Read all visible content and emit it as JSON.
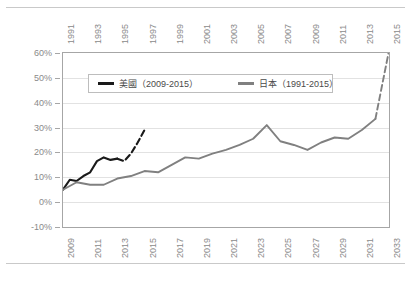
{
  "chart_data": {
    "type": "line",
    "title": "",
    "xlabel": "",
    "ylabel": "",
    "ylim": [
      -10,
      60
    ],
    "ytick_labels": [
      "60%",
      "50%",
      "40%",
      "30%",
      "20%",
      "10%",
      "0%",
      "-10%"
    ],
    "ytick_values": [
      60,
      50,
      40,
      30,
      20,
      10,
      0,
      -10
    ],
    "grid": true,
    "legend_position": "upper-left-inside",
    "axes": {
      "top_axis": {
        "name": "japan-years",
        "tick_labels": [
          "1991",
          "1993",
          "1995",
          "1997",
          "1999",
          "2001",
          "2003",
          "2005",
          "2007",
          "2009",
          "2011",
          "2013",
          "2015"
        ],
        "range": [
          1991,
          2015
        ]
      },
      "bottom_axis": {
        "name": "us-years",
        "tick_labels": [
          "2009",
          "2011",
          "2013",
          "2015",
          "2017",
          "2019",
          "2021",
          "2023",
          "2025",
          "2027",
          "2029",
          "2031",
          "2033"
        ],
        "range": [
          2009,
          2033
        ]
      }
    },
    "series": [
      {
        "name": "美國（2009-2015）",
        "short_name": "us",
        "color": "#1a1a1a",
        "axis": "bottom",
        "x": [
          2009,
          2009.5,
          2010,
          2010.5,
          2011,
          2011.5,
          2012,
          2012.5,
          2013,
          2013.5,
          2014,
          2014.5,
          2015
        ],
        "values": [
          5.0,
          9.0,
          8.5,
          10.5,
          12.0,
          16.5,
          18.0,
          17.0,
          17.5,
          16.5,
          19.5,
          24.0,
          29.0
        ],
        "solid_until": 2013,
        "dashed_from": 2013,
        "dashed_note": "projection"
      },
      {
        "name": "日本（1991-2015）",
        "short_name": "japan",
        "color": "#808080",
        "axis": "top",
        "x": [
          1991,
          1992,
          1993,
          1994,
          1995,
          1996,
          1997,
          1998,
          1999,
          2000,
          2001,
          2002,
          2003,
          2004,
          2005,
          2006,
          2007,
          2008,
          2009,
          2010,
          2011,
          2012,
          2013,
          2014,
          2015
        ],
        "values": [
          5.0,
          8.0,
          7.0,
          7.0,
          9.5,
          10.5,
          12.5,
          12.0,
          15.0,
          18.0,
          17.5,
          19.5,
          21.0,
          23.0,
          25.5,
          31.0,
          24.5,
          23.0,
          21.0,
          24.0,
          26.0,
          25.5,
          29.0,
          33.5,
          61.0
        ],
        "solid_until": 2014,
        "dashed_from": 2014,
        "dashed_note": "projection"
      }
    ]
  },
  "legend": {
    "items": [
      {
        "label": "美國（2009-2015）",
        "color": "#1a1a1a"
      },
      {
        "label": "日本（1991-2015）",
        "color": "#808080"
      }
    ]
  },
  "colors": {
    "us_line": "#1a1a1a",
    "japan_line": "#808080",
    "gridline": "#e2e2e2",
    "axis_border": "#a6a6a6",
    "tick_text": "#8a8a8a",
    "frame_rule": "#c9c9c9",
    "background": "#ffffff"
  }
}
